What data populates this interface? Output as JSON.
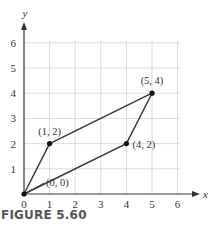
{
  "chart_data": {
    "type": "line",
    "title": "",
    "xlabel": "x",
    "ylabel": "y",
    "xlim": [
      0,
      6
    ],
    "ylim": [
      0,
      6
    ],
    "grid": true,
    "x_ticks": [
      "0",
      "1",
      "2",
      "3",
      "4",
      "5",
      "6"
    ],
    "y_ticks": [
      "1",
      "2",
      "3",
      "4",
      "5",
      "6"
    ],
    "series": [
      {
        "name": "parallelogram",
        "closed": true,
        "points": [
          {
            "x": 0,
            "y": 0,
            "label": "(0, 0)"
          },
          {
            "x": 1,
            "y": 2,
            "label": "(1, 2)"
          },
          {
            "x": 5,
            "y": 4,
            "label": "(5, 4)"
          },
          {
            "x": 4,
            "y": 2,
            "label": "(4, 2)"
          }
        ]
      }
    ],
    "annotations": [
      "(0, 0)",
      "(1, 2)",
      "(5, 4)",
      "(4, 2)"
    ]
  },
  "figure": {
    "caption": "FIGURE 5.60",
    "colors": {
      "grid": "#dcdcdc",
      "axis": "#333333",
      "line": "#333333",
      "point": "#111111"
    }
  }
}
